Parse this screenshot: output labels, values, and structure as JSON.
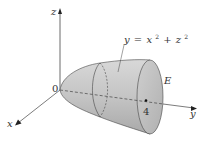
{
  "figure": {
    "type": "3d-solid-diagram",
    "axes": {
      "z_label": "z",
      "x_label": "x",
      "y_label": "y",
      "origin_label": "0"
    },
    "surface_equation": {
      "lhs": "y",
      "eq": "=",
      "x_term": "x",
      "x_exp": "2",
      "plus": "+",
      "z_term": "z",
      "z_exp": "2"
    },
    "region_label": "E",
    "y_tick_label": "4",
    "colors": {
      "surface_fill": "#c8c8c8",
      "surface_dark": "#a8a8a8",
      "cap_fill": "#b8b8b8",
      "line": "#444444"
    }
  }
}
